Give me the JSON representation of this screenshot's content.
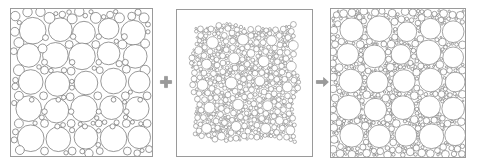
{
  "figure": {
    "background_color": "#ffffff",
    "stroke_color": "#6b6b6b",
    "frame_color": "#9a9a9a",
    "panel_count": 3
  },
  "connectors": [
    {
      "id": "plus",
      "symbol": "+",
      "name": "plus-icon",
      "color": "#8b8b8b"
    },
    {
      "id": "arrow",
      "symbol": "→",
      "name": "right-arrow-icon",
      "color": "#8b8b8b"
    }
  ],
  "panels": [
    {
      "id": "panel-large",
      "label": "large circle packing",
      "description": "Loose packing of large and medium circles inside a square frame",
      "frame": {
        "x": 10,
        "y": 8,
        "width": 143,
        "height": 149
      },
      "circle_count": 78,
      "radius_range": [
        2.0,
        17.5
      ],
      "fill": "#ffffff",
      "stroke": "#6b6b6b",
      "stroke_width": 0.7
    },
    {
      "id": "panel-small",
      "label": "small circle packing",
      "description": "Dense cluster of very small circles with a few larger inclusions, irregular outline",
      "frame": {
        "x": 176,
        "y": 9,
        "width": 137,
        "height": 148
      },
      "circle_count": 1150,
      "radius_range": [
        0.7,
        6.5
      ],
      "fill": "#ffffff",
      "stroke": "#555555",
      "stroke_width": 0.45
    },
    {
      "id": "panel-mixed",
      "label": "combined packing",
      "description": "Large circles with small circles filling the interstitial gaps",
      "frame": {
        "x": 330,
        "y": 8,
        "width": 136,
        "height": 150
      },
      "circle_count": 780,
      "radius_range": [
        0.8,
        15.0
      ],
      "fill": "#ffffff",
      "stroke": "#5a5a5a",
      "stroke_width": 0.55
    }
  ],
  "chart_data": {
    "type": "scatter",
    "title": "",
    "xlabel": "",
    "ylabel": "",
    "panels": [
      {
        "name": "large circle packing",
        "units": "panel-local pixels",
        "xlim": [
          0,
          143
        ],
        "ylim": [
          0,
          149
        ],
        "circles": [
          [
            22,
            22,
            13.5
          ],
          [
            50,
            21,
            12.0
          ],
          [
            74,
            24,
            11.5
          ],
          [
            99,
            20,
            10.5
          ],
          [
            124,
            24,
            12.5
          ],
          [
            39,
            9,
            5.5
          ],
          [
            62,
            10,
            5.0
          ],
          [
            86,
            9,
            5.5
          ],
          [
            110,
            9,
            5.0
          ],
          [
            135,
            9,
            5.0
          ],
          [
            18,
            47,
            12.0
          ],
          [
            45,
            47,
            13.0
          ],
          [
            72,
            48,
            13.5
          ],
          [
            99,
            45,
            11.5
          ],
          [
            126,
            48,
            12.0
          ],
          [
            8,
            34,
            5.0
          ],
          [
            8,
            62,
            5.5
          ],
          [
            136,
            35,
            4.5
          ],
          [
            136,
            62,
            5.0
          ],
          [
            32,
            40,
            4.5
          ],
          [
            59,
            36,
            4.0
          ],
          [
            86,
            36,
            4.0
          ],
          [
            113,
            36,
            4.5
          ],
          [
            20,
            74,
            12.5
          ],
          [
            47,
            76,
            12.5
          ],
          [
            76,
            75,
            12.0
          ],
          [
            104,
            73,
            13.0
          ],
          [
            130,
            74,
            11.0
          ],
          [
            34,
            62,
            4.0
          ],
          [
            61,
            63,
            4.0
          ],
          [
            90,
            62,
            3.5
          ],
          [
            117,
            61,
            4.0
          ],
          [
            18,
            101,
            13.0
          ],
          [
            46,
            103,
            12.5
          ],
          [
            74,
            101,
            13.5
          ],
          [
            102,
            100,
            12.0
          ],
          [
            128,
            101,
            12.0
          ],
          [
            8,
            88,
            4.5
          ],
          [
            33,
            88,
            4.0
          ],
          [
            60,
            89,
            4.0
          ],
          [
            88,
            88,
            4.0
          ],
          [
            116,
            88,
            4.0
          ],
          [
            138,
            88,
            4.0
          ],
          [
            20,
            131,
            13.5
          ],
          [
            48,
            132,
            12.5
          ],
          [
            76,
            130,
            12.0
          ],
          [
            104,
            131,
            13.5
          ],
          [
            130,
            130,
            11.5
          ],
          [
            8,
            116,
            4.5
          ],
          [
            34,
            116,
            4.0
          ],
          [
            61,
            116,
            4.0
          ],
          [
            89,
            116,
            3.5
          ],
          [
            117,
            116,
            4.0
          ],
          [
            138,
            116,
            4.0
          ],
          [
            9,
            143,
            4.5
          ],
          [
            34,
            144,
            4.0
          ],
          [
            62,
            144,
            4.0
          ],
          [
            90,
            144,
            3.5
          ],
          [
            118,
            144,
            4.0
          ],
          [
            140,
            142,
            3.5
          ],
          [
            35,
            29,
            3.0
          ],
          [
            63,
            28,
            2.8
          ],
          [
            89,
            28,
            2.8
          ],
          [
            115,
            28,
            3.0
          ],
          [
            34,
            54,
            3.0
          ],
          [
            62,
            54,
            2.8
          ],
          [
            89,
            54,
            2.8
          ],
          [
            116,
            54,
            3.0
          ],
          [
            34,
            104,
            2.8
          ],
          [
            61,
            104,
            2.8
          ],
          [
            89,
            104,
            2.6
          ],
          [
            117,
            104,
            2.8
          ],
          [
            47,
            119,
            2.6
          ],
          [
            75,
            119,
            2.6
          ],
          [
            103,
            119,
            2.6
          ],
          [
            21,
            92,
            2.4
          ],
          [
            48,
            92,
            2.4
          ],
          [
            104,
            92,
            2.4
          ],
          [
            131,
            92,
            2.4
          ]
        ]
      },
      {
        "name": "small circle packing",
        "units": "panel-local pixels",
        "xlim": [
          0,
          137
        ],
        "ylim": [
          0,
          148
        ],
        "note": "~1150 circles, radii 0.7-6.5 px, irregular outline inset ~18px from frame; a sparse set of larger inclusions listed below",
        "large_inclusions": [
          [
            36,
            33,
            6.0
          ],
          [
            67,
            30,
            5.5
          ],
          [
            96,
            31,
            5.0
          ],
          [
            118,
            36,
            5.0
          ],
          [
            30,
            55,
            5.0
          ],
          [
            58,
            49,
            5.5
          ],
          [
            88,
            52,
            5.5
          ],
          [
            116,
            57,
            5.0
          ],
          [
            26,
            76,
            5.5
          ],
          [
            55,
            74,
            6.0
          ],
          [
            84,
            72,
            5.0
          ],
          [
            112,
            78,
            5.0
          ],
          [
            33,
            99,
            5.5
          ],
          [
            62,
            96,
            5.5
          ],
          [
            92,
            97,
            5.0
          ],
          [
            118,
            101,
            4.5
          ],
          [
            30,
            120,
            5.0
          ],
          [
            60,
            118,
            5.0
          ],
          [
            90,
            120,
            5.0
          ],
          [
            115,
            122,
            4.5
          ],
          [
            22,
            41,
            4.0
          ],
          [
            104,
            112,
            4.0
          ],
          [
            45,
            128,
            4.0
          ],
          [
            75,
            44,
            4.0
          ]
        ]
      },
      {
        "name": "combined packing",
        "units": "panel-local pixels",
        "xlim": [
          0,
          136
        ],
        "ylim": [
          0,
          150
        ],
        "note": "Large circles reproduce panel 1 layout; remaining interstices filled with small circles of radius 1-4 px",
        "large_circles": [
          [
            21,
            21,
            12.0
          ],
          [
            49,
            20,
            13.0
          ],
          [
            77,
            23,
            10.0
          ],
          [
            101,
            20,
            10.5
          ],
          [
            124,
            23,
            11.0
          ],
          [
            17,
            46,
            11.0
          ],
          [
            44,
            48,
            11.5
          ],
          [
            71,
            46,
            10.0
          ],
          [
            99,
            44,
            12.5
          ],
          [
            124,
            49,
            10.5
          ],
          [
            20,
            73,
            12.0
          ],
          [
            47,
            74,
            11.0
          ],
          [
            74,
            73,
            11.5
          ],
          [
            101,
            72,
            12.0
          ],
          [
            126,
            74,
            10.0
          ],
          [
            18,
            100,
            12.5
          ],
          [
            45,
            102,
            11.5
          ],
          [
            73,
            100,
            12.0
          ],
          [
            100,
            99,
            11.0
          ],
          [
            124,
            101,
            11.5
          ],
          [
            21,
            128,
            12.0
          ],
          [
            49,
            129,
            11.5
          ],
          [
            76,
            128,
            11.0
          ],
          [
            102,
            129,
            12.5
          ],
          [
            126,
            128,
            10.5
          ]
        ]
      }
    ]
  }
}
